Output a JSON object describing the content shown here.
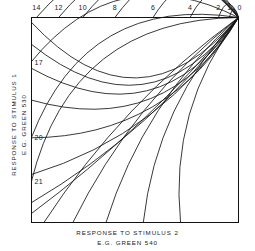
{
  "chart_data": {
    "type": "line",
    "title": "",
    "xlabel": "RESPONSE TO STIMULUS 2",
    "xlabel_sub": "E.G. GREEN 540",
    "ylabel": "RESPONSE TO STIMULUS 1",
    "ylabel_sub": "E.G. GREEN 530",
    "grid": false,
    "legend": "none",
    "xlim": [
      0,
      1
    ],
    "ylim": [
      0,
      1
    ],
    "top_axis_ticks": [
      {
        "label": "14",
        "x": 0.024
      },
      {
        "label": "12",
        "x": 0.131
      },
      {
        "label": "10",
        "x": 0.248
      },
      {
        "label": "8",
        "x": 0.403
      },
      {
        "label": "6",
        "x": 0.587
      },
      {
        "label": "4",
        "x": 0.766
      },
      {
        "label": "2",
        "x": 0.903
      },
      {
        "label": "1",
        "x": 0.956
      },
      {
        "label": "0",
        "x": 1.005
      }
    ],
    "left_axis_ticks": [
      {
        "label": "17",
        "y": 0.215
      },
      {
        "label": "20",
        "y": 0.585
      },
      {
        "label": "21",
        "y": 0.798
      }
    ],
    "series": [
      {
        "name": "14",
        "start_x": 0.024,
        "kind": "arc"
      },
      {
        "name": "12",
        "start_x": 0.131,
        "kind": "arc"
      },
      {
        "name": "10",
        "start_x": 0.248,
        "kind": "arc"
      },
      {
        "name": "8",
        "start_x": 0.403,
        "kind": "arc"
      },
      {
        "name": "6",
        "start_x": 0.587,
        "kind": "arc"
      },
      {
        "name": "4",
        "start_x": 0.766,
        "kind": "arc"
      },
      {
        "name": "2",
        "start_x": 0.903,
        "kind": "arc"
      },
      {
        "name": "1",
        "start_x": 0.956,
        "kind": "arc"
      },
      {
        "name": "17",
        "start_y": 0.215,
        "kind": "arc"
      },
      {
        "name": "20",
        "start_y": 0.585,
        "kind": "arc"
      },
      {
        "name": "21",
        "start_y": 0.798,
        "kind": "arc"
      }
    ],
    "colors": {
      "curve": "#151515",
      "frame": "#111111",
      "background": "#ffffff",
      "text": "#1a1a1a"
    }
  }
}
